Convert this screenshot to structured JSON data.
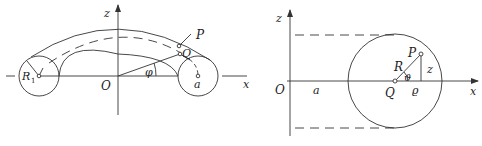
{
  "figure_left": {
    "title": "Torus (ring) with coordinates",
    "labels": {
      "z_axis": "z",
      "x_axis": "x",
      "origin": "O",
      "phi": "φ",
      "point_P": "P",
      "point_Q": "Q",
      "radius_a": "a",
      "radius_R1": "R",
      "radius_R1_sub": "1"
    }
  },
  "figure_right": {
    "title": "Cross-section of torus",
    "labels": {
      "z_axis": "z",
      "x_axis": "x",
      "origin": "O",
      "dist_a": "a",
      "point_Q": "Q",
      "point_P": "P",
      "radius_R": "R",
      "theta": "ϑ",
      "rho": "ϱ",
      "z_height": "z"
    }
  },
  "colors": {
    "line": "#333333",
    "background": "#ffffff"
  }
}
